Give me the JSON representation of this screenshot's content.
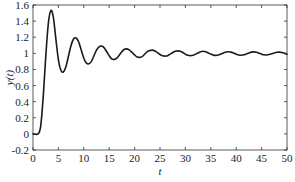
{
  "chart_data": {
    "type": "line",
    "title": "",
    "xlabel": "t",
    "ylabel": "y(t)",
    "xlim": [
      0,
      50
    ],
    "ylim": [
      -0.2,
      1.6
    ],
    "xticks": [
      0,
      5,
      10,
      15,
      20,
      25,
      30,
      35,
      40,
      45,
      50
    ],
    "xtick_labels": [
      "0",
      "5",
      "10",
      "15",
      "20",
      "25",
      "30",
      "35",
      "40",
      "45",
      "50"
    ],
    "yticks": [
      -0.2,
      0,
      0.2,
      0.4,
      0.6,
      0.8,
      1.0,
      1.2,
      1.4,
      1.6
    ],
    "ytick_labels": [
      "-0.2",
      "0",
      "0.2",
      "0.4",
      "0.6",
      "0.8",
      "1",
      "1.2",
      "1.4",
      "1.6"
    ],
    "grid": false,
    "legend": null,
    "series": [
      {
        "name": "y(t)",
        "color": "#1a1a1a",
        "x": [
          0,
          1.0,
          1.5,
          2.0,
          2.5,
          3.0,
          3.5,
          4.0,
          4.5,
          5.0,
          5.5,
          6.0,
          6.5,
          7.0,
          7.5,
          8.0,
          8.5,
          9.0,
          9.5,
          10.0,
          10.5,
          11.0,
          11.5,
          12.0,
          12.5,
          13.0,
          13.5,
          14.0,
          14.5,
          15.0,
          15.5,
          16.0,
          16.5,
          17.0,
          17.5,
          18.0,
          18.5,
          19.0,
          19.5,
          20.0,
          20.5,
          21.0,
          21.5,
          22.0,
          22.5,
          23.0,
          23.5,
          24.0,
          24.5,
          25.0,
          25.5,
          26.0,
          26.5,
          27.0,
          27.5,
          28.0,
          28.5,
          29.0,
          29.5,
          30.0,
          30.5,
          31.0,
          31.5,
          32.0,
          32.5,
          33.0,
          33.5,
          34.0,
          34.5,
          35.0,
          35.5,
          36.0,
          36.5,
          37.0,
          37.5,
          38.0,
          38.5,
          39.0,
          39.5,
          40.0,
          40.5,
          41.0,
          41.5,
          42.0,
          42.5,
          43.0,
          43.5,
          44.0,
          44.5,
          45.0,
          45.5,
          46.0,
          46.5,
          47.0,
          47.5,
          48.0,
          48.5,
          49.0,
          49.5,
          50.0
        ],
        "y": [
          0,
          0,
          0.09,
          0.45,
          0.95,
          1.36,
          1.53,
          1.45,
          1.18,
          0.92,
          0.79,
          0.77,
          0.84,
          0.97,
          1.1,
          1.18,
          1.19,
          1.14,
          1.04,
          0.94,
          0.88,
          0.87,
          0.9,
          0.97,
          1.04,
          1.08,
          1.09,
          1.07,
          1.02,
          0.97,
          0.93,
          0.925,
          0.94,
          0.98,
          1.02,
          1.05,
          1.055,
          1.04,
          1.01,
          0.98,
          0.955,
          0.95,
          0.96,
          0.99,
          1.02,
          1.035,
          1.04,
          1.03,
          1.01,
          0.985,
          0.97,
          0.965,
          0.97,
          0.99,
          1.01,
          1.025,
          1.03,
          1.025,
          1.01,
          0.99,
          0.975,
          0.97,
          0.975,
          0.99,
          1.005,
          1.02,
          1.025,
          1.02,
          1.005,
          0.99,
          0.978,
          0.975,
          0.98,
          0.992,
          1.005,
          1.017,
          1.02,
          1.015,
          1.003,
          0.99,
          0.98,
          0.977,
          0.982,
          0.993,
          1.005,
          1.015,
          1.018,
          1.013,
          1.002,
          0.99,
          0.982,
          0.98,
          0.985,
          0.995,
          1.005,
          1.013,
          1.015,
          1.01,
          1.0,
          0.99
        ]
      }
    ]
  }
}
